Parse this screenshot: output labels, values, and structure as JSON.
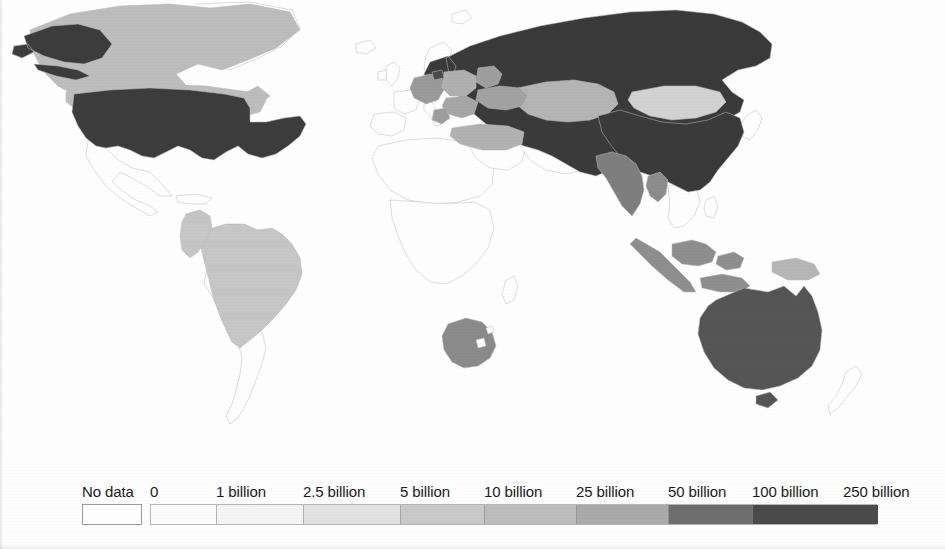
{
  "legend": {
    "no_data_label": "No data",
    "no_data_color": "#ffffff",
    "labels": [
      {
        "text": "No data",
        "x": 82
      },
      {
        "text": "0",
        "x": 150
      },
      {
        "text": "1 billion",
        "x": 216
      },
      {
        "text": "2.5 billion",
        "x": 303
      },
      {
        "text": "5 billion",
        "x": 400
      },
      {
        "text": "10 billion",
        "x": 484
      },
      {
        "text": "25 billion",
        "x": 576
      },
      {
        "text": "50 billion",
        "x": 668
      },
      {
        "text": "100 billion",
        "x": 752
      },
      {
        "text": "250 billion",
        "x": 843
      }
    ],
    "bins": [
      {
        "from": "0",
        "to": "1 billion",
        "color": "#fcfcfc",
        "width": 66
      },
      {
        "from": "1 billion",
        "to": "2.5 billion",
        "color": "#f4f4f4",
        "width": 87
      },
      {
        "from": "2.5 billion",
        "to": "5 billion",
        "color": "#e2e2e2",
        "width": 97
      },
      {
        "from": "5 billion",
        "to": "10 billion",
        "color": "#c9c9c9",
        "width": 84
      },
      {
        "from": "10 billion",
        "to": "25 billion",
        "color": "#bdbdbd",
        "width": 92
      },
      {
        "from": "25 billion",
        "to": "50 billion",
        "color": "#aaaaaa",
        "width": 92
      },
      {
        "from": "50 billion",
        "to": "100 billion",
        "color": "#6e6e6e",
        "width": 84
      },
      {
        "from": "100 billion",
        "to": "250 billion",
        "color": "#4a4a4a",
        "width": 125
      }
    ]
  },
  "chart_data": {
    "type": "heatmap",
    "title": "",
    "subtitle": "",
    "legend_position": "bottom",
    "grid": false,
    "value_unit": "billion",
    "scale_breaks": [
      0,
      1,
      2.5,
      5,
      10,
      25,
      50,
      100,
      250
    ],
    "scale_break_labels": [
      "0",
      "1 billion",
      "2.5 billion",
      "5 billion",
      "10 billion",
      "25 billion",
      "50 billion",
      "100 billion",
      "250 billion"
    ],
    "no_data_label": "No data",
    "palette": [
      "#fcfcfc",
      "#f4f4f4",
      "#e2e2e2",
      "#c9c9c9",
      "#bdbdbd",
      "#aaaaaa",
      "#6e6e6e",
      "#4a4a4a"
    ],
    "regions": [
      {
        "name": "United States",
        "bin": "100 billion - 250 billion",
        "color": "#3c3c3c"
      },
      {
        "name": "Canada",
        "bin": "10 billion - 25 billion",
        "color": "#bdbdbd"
      },
      {
        "name": "Greenland",
        "bin": "No data",
        "color": "#ffffff"
      },
      {
        "name": "Mexico",
        "bin": "No data",
        "color": "#ffffff"
      },
      {
        "name": "Brazil",
        "bin": "5 billion - 10 billion",
        "color": "#c6c6c6"
      },
      {
        "name": "Colombia",
        "bin": "5 billion - 10 billion",
        "color": "#c6c6c6"
      },
      {
        "name": "Venezuela",
        "bin": "No data",
        "color": "#ffffff"
      },
      {
        "name": "Argentina",
        "bin": "No data",
        "color": "#ffffff"
      },
      {
        "name": "Russia",
        "bin": "100 billion - 250 billion",
        "color": "#3a3a3a"
      },
      {
        "name": "China",
        "bin": "100 billion - 250 billion",
        "color": "#3a3a3a"
      },
      {
        "name": "India",
        "bin": "25 billion - 50 billion",
        "color": "#7e7e7e"
      },
      {
        "name": "Kazakhstan",
        "bin": "10 billion - 25 billion",
        "color": "#b4b4b4"
      },
      {
        "name": "Mongolia",
        "bin": "5 billion - 10 billion",
        "color": "#d2d2d2"
      },
      {
        "name": "Germany",
        "bin": "25 billion - 50 billion",
        "color": "#9a9a9a"
      },
      {
        "name": "Poland",
        "bin": "10 billion - 25 billion",
        "color": "#b0b0b0"
      },
      {
        "name": "Ukraine",
        "bin": "25 billion - 50 billion",
        "color": "#a2a2a2"
      },
      {
        "name": "Belarus",
        "bin": "25 billion - 50 billion",
        "color": "#9e9e9e"
      },
      {
        "name": "Turkey",
        "bin": "10 billion - 25 billion",
        "color": "#b2b2b2"
      },
      {
        "name": "Romania",
        "bin": "25 billion - 50 billion",
        "color": "#a6a6a6"
      },
      {
        "name": "Japan",
        "bin": "No data",
        "color": "#ffffff"
      },
      {
        "name": "Indonesia",
        "bin": "25 billion - 50 billion",
        "color": "#8e8e8e"
      },
      {
        "name": "Papua New Guinea",
        "bin": "10 billion - 25 billion",
        "color": "#b6b6b6"
      },
      {
        "name": "Australia",
        "bin": "50 billion - 100 billion",
        "color": "#555555"
      },
      {
        "name": "New Zealand",
        "bin": "No data",
        "color": "#ffffff"
      },
      {
        "name": "South Africa",
        "bin": "25 billion - 50 billion",
        "color": "#8a8a8a"
      },
      {
        "name": "Rest of world",
        "bin": "No data",
        "color": "#ffffff"
      }
    ]
  }
}
